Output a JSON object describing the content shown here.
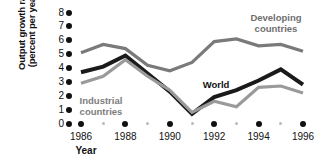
{
  "chart_data": {
    "type": "line",
    "title": "",
    "xlabel": "Year",
    "ylabel": "Output growth rate (percent per year)",
    "ylabel_line1": "Output growth rate",
    "ylabel_line2": "(percent per year)",
    "xlim": [
      1985.5,
      1996.5
    ],
    "ylim": [
      0,
      8
    ],
    "ytick_values": [
      8,
      7,
      6,
      5,
      4,
      3,
      2,
      1,
      0
    ],
    "ytick_labels": [
      "8",
      "7",
      "6",
      "5",
      "4",
      "3",
      "2",
      "1",
      "0"
    ],
    "xtick_values": [
      1986,
      1988,
      1990,
      1992,
      1994,
      1996
    ],
    "xtick_labels": [
      "1986",
      "1988",
      "1990",
      "1992",
      "1994",
      "1996"
    ],
    "xtick_minor_values": [
      1987,
      1989,
      1991,
      1993,
      1995
    ],
    "grid": false,
    "legend_position": "inline-annotations",
    "x": [
      1986,
      1987,
      1988,
      1989,
      1990,
      1991,
      1992,
      1993,
      1994,
      1995,
      1996
    ],
    "series": [
      {
        "name": "Developing countries",
        "color": "#7a7a7a",
        "values": [
          5.1,
          5.7,
          5.4,
          4.2,
          3.8,
          4.4,
          5.9,
          6.1,
          5.6,
          5.7,
          5.2
        ]
      },
      {
        "name": "World",
        "color": "#1a1a1a",
        "values": [
          3.7,
          4.1,
          4.9,
          3.6,
          2.3,
          0.7,
          1.9,
          2.4,
          3.1,
          3.9,
          2.8
        ]
      },
      {
        "name": "Industrial countries",
        "color": "#9a9a9a",
        "values": [
          2.9,
          3.4,
          4.6,
          3.4,
          2.4,
          0.8,
          1.6,
          1.2,
          2.6,
          2.7,
          2.2
        ]
      }
    ],
    "annotations": [
      {
        "text": "Developing\ncountries",
        "line1": "Developing",
        "line2": "countries",
        "series": "Developing countries"
      },
      {
        "text": "World",
        "line1": "World",
        "line2": "",
        "series": "World"
      },
      {
        "text": "Industrial\ncountries",
        "line1": "Industrial",
        "line2": "countries",
        "series": "Industrial countries"
      }
    ]
  }
}
